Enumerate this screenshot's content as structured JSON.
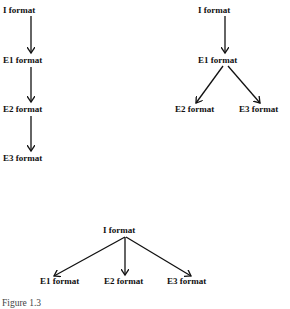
{
  "diagrams": [
    {
      "name": "linear-chain",
      "nodes": [
        "I format",
        "E1 format",
        "E2 format",
        "E3 format"
      ],
      "edges": [
        [
          "I format",
          "E1 format"
        ],
        [
          "E1 format",
          "E2 format"
        ],
        [
          "E2 format",
          "E3 format"
        ]
      ]
    },
    {
      "name": "branch-from-e1",
      "nodes": [
        "I format",
        "E1 format",
        "E2 format",
        "E3 format"
      ],
      "edges": [
        [
          "I format",
          "E1 format"
        ],
        [
          "E1 format",
          "E2 format"
        ],
        [
          "E1 format",
          "E3 format"
        ]
      ]
    },
    {
      "name": "branch-from-i",
      "nodes": [
        "I format",
        "E1 format",
        "E2 format",
        "E3 format"
      ],
      "edges": [
        [
          "I format",
          "E1 format"
        ],
        [
          "I format",
          "E2 format"
        ],
        [
          "I format",
          "E3 format"
        ]
      ]
    }
  ],
  "caption": "Figure 1.3"
}
